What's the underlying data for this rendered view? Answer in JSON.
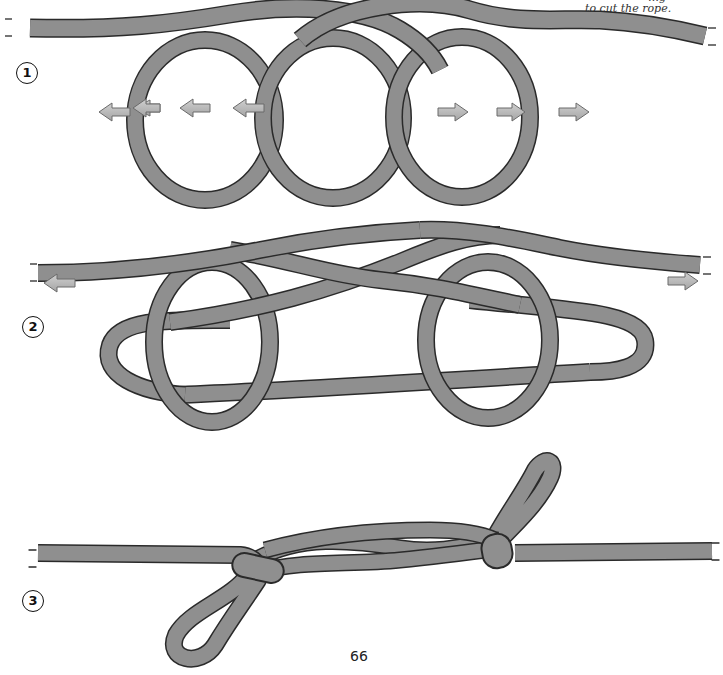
{
  "caption": {
    "partial_line": "…g",
    "line": "to cut the rope."
  },
  "steps": [
    {
      "number": "1",
      "description": "three interlocked loops with arrows pointing outward"
    },
    {
      "number": "2",
      "description": "ends pulled, loops tightening"
    },
    {
      "number": "3",
      "description": "finished knot with two loops"
    }
  ],
  "page_number": "66",
  "colors": {
    "rope_fill": "#8f8f8f",
    "rope_outline": "#2a2a2a",
    "arrow_fill": "#b8b8b8",
    "arrow_outline": "#6a6a6a",
    "background": "#ffffff"
  },
  "icons": {
    "arrow_left": "arrow-left-icon",
    "arrow_right": "arrow-right-icon"
  }
}
